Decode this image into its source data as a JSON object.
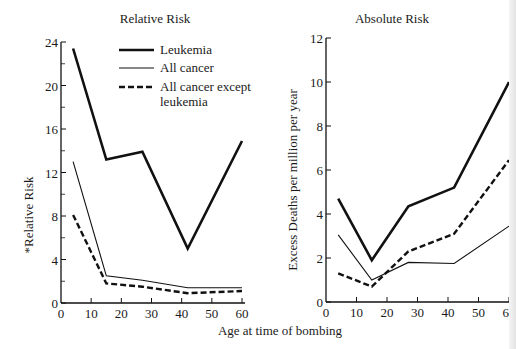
{
  "chart_data": [
    {
      "type": "line",
      "title": "Relative Risk",
      "xlabel": "Age at time of bombing",
      "ylabel": "*Relative Risk",
      "xlim": [
        0,
        60
      ],
      "ylim": [
        0,
        24
      ],
      "xticks": [
        0,
        10,
        20,
        30,
        40,
        50,
        60
      ],
      "yticks": [
        0,
        4,
        8,
        12,
        16,
        20,
        24
      ],
      "grid": false,
      "legend_position": "upper center",
      "x": [
        4,
        15,
        27,
        42,
        60
      ],
      "series": [
        {
          "name": "Leukemia",
          "style": "thick-solid",
          "values": [
            23.4,
            13.2,
            13.9,
            5.0,
            14.9
          ]
        },
        {
          "name": "All cancer",
          "style": "thin-solid",
          "values": [
            13.0,
            2.5,
            2.1,
            1.4,
            1.4
          ]
        },
        {
          "name": "All cancer except leukemia",
          "style": "dashed",
          "values": [
            8.1,
            1.8,
            1.5,
            0.9,
            1.1
          ]
        }
      ]
    },
    {
      "type": "line",
      "title": "Absolute Risk",
      "xlabel": "Age at time of bombing",
      "ylabel": "Excess Deaths per million per year",
      "xlim": [
        0,
        60
      ],
      "ylim": [
        0,
        12
      ],
      "xticks": [
        0,
        10,
        20,
        30,
        40,
        50,
        60
      ],
      "yticks": [
        0,
        2,
        4,
        6,
        8,
        10,
        12
      ],
      "grid": false,
      "x": [
        4,
        15,
        27,
        42,
        60
      ],
      "series": [
        {
          "name": "Leukemia",
          "style": "thick-solid",
          "values": [
            4.7,
            1.9,
            4.35,
            5.2,
            10.0
          ]
        },
        {
          "name": "All cancer",
          "style": "thin-solid",
          "values": [
            3.05,
            1.0,
            1.8,
            1.75,
            3.45
          ]
        },
        {
          "name": "All cancer except leukemia",
          "style": "dashed",
          "values": [
            1.3,
            0.7,
            2.3,
            3.1,
            6.45
          ]
        }
      ]
    }
  ],
  "labels": {
    "left_title": "Relative Risk",
    "right_title": "Absolute Risk",
    "left_ylabel": "*Relative Risk",
    "right_ylabel": "Excess Deaths per million per year",
    "xlabel": "Age at time of bombing",
    "legend": [
      "Leukemia",
      "All cancer",
      "All cancer except",
      "leukemia"
    ]
  }
}
